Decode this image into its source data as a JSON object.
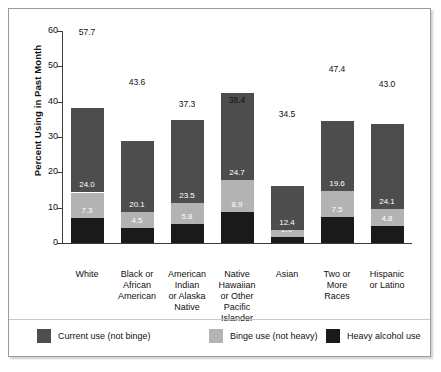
{
  "chart_data": {
    "type": "bar",
    "subtype": "stacked-bar",
    "title": "",
    "xlabel": "",
    "ylabel": "Percent Using in Past Month",
    "ylim": [
      0,
      60
    ],
    "ytick_values": [
      0,
      10,
      20,
      30,
      40,
      50,
      60
    ],
    "ytick_labels": [
      "0",
      "10",
      "20",
      "30",
      "40",
      "50",
      "60"
    ],
    "grid": false,
    "legend_position": "bottom",
    "categories": [
      "White",
      "Black or African American",
      "American Indian or Alaska Native",
      "Native Hawaiian or Other Pacific Islander",
      "Asian",
      "Two or More Races",
      "Hispanic or Latino"
    ],
    "category_lines": [
      [
        "White"
      ],
      [
        "Black or",
        "African",
        "American"
      ],
      [
        "American",
        "Indian",
        "or Alaska",
        "Native"
      ],
      [
        "Native",
        "Hawaiian",
        "or Other",
        "Pacific",
        "Islander"
      ],
      [
        "Asian"
      ],
      [
        "Two or",
        "More",
        "Races"
      ],
      [
        "Hispanic",
        "or Latino"
      ]
    ],
    "series": [
      {
        "name": "Current use (not binge)",
        "color": "#4d4d4d",
        "values": [
          24.0,
          20.1,
          23.5,
          24.7,
          12.4,
          19.6,
          24.1
        ],
        "labels": [
          "24.0",
          "20.1",
          "23.5",
          "24.7",
          "12.4",
          "19.6",
          "24.1"
        ]
      },
      {
        "name": "Binge use (not heavy)",
        "color": "#b3b3b3",
        "values": [
          7.3,
          4.5,
          5.8,
          8.9,
          2.0,
          7.5,
          4.8
        ],
        "labels": [
          "7.3",
          "4.5",
          "5.8",
          "8.9",
          "2.0",
          "7.5",
          "4.8"
        ]
      },
      {
        "name": "Heavy alcohol use",
        "color": "#1a1a1a",
        "values": [
          7.0,
          4.3,
          5.5,
          8.8,
          1.7,
          7.3,
          4.9
        ],
        "labels": [
          "",
          "",
          "",
          "",
          "",
          "",
          ""
        ]
      }
    ],
    "totals": [
      57.7,
      43.6,
      37.3,
      38.4,
      34.5,
      47.4,
      43.0
    ],
    "total_labels": [
      "57.7",
      "43.6",
      "37.3",
      "38.4",
      "34.5",
      "47.4",
      "43.0"
    ],
    "legend": [
      {
        "label": "Current use (not binge)",
        "color": "#4d4d4d"
      },
      {
        "label": "Binge use (not heavy)",
        "color": "#b3b3b3"
      },
      {
        "label": "Heavy alcohol use",
        "color": "#1a1a1a"
      }
    ]
  }
}
